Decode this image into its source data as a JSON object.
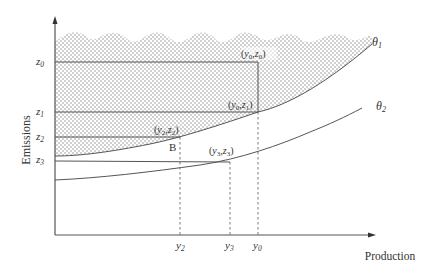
{
  "axes": {
    "y_label": "Emissions",
    "x_label": "Production"
  },
  "y_ticks": [
    {
      "id": "z0",
      "base": "z",
      "sub": "0"
    },
    {
      "id": "z1",
      "base": "z",
      "sub": "1"
    },
    {
      "id": "z2",
      "base": "z",
      "sub": "2"
    },
    {
      "id": "z3",
      "base": "z",
      "sub": "3"
    }
  ],
  "x_ticks": [
    {
      "id": "y2",
      "base": "y",
      "sub": "2"
    },
    {
      "id": "y3",
      "base": "y",
      "sub": "3"
    },
    {
      "id": "y0",
      "base": "y",
      "sub": "0"
    }
  ],
  "curves": [
    {
      "id": "theta1",
      "base": "θ",
      "sub": "1",
      "role": "upper frontier, shaded region above"
    },
    {
      "id": "theta2",
      "base": "θ",
      "sub": "2",
      "role": "lower frontier"
    }
  ],
  "points": [
    {
      "id": "y0z0",
      "label": "(y0,z0)",
      "x": "y0",
      "z": "z0"
    },
    {
      "id": "y0z1",
      "label": "(y0,z1)",
      "x": "y0",
      "z": "z1"
    },
    {
      "id": "y2z2",
      "label": "(y2,z2)",
      "x": "y2",
      "z": "z2"
    },
    {
      "id": "y3z3",
      "label": "(y3,z3)",
      "x": "y3",
      "z": "z3"
    }
  ],
  "marker": {
    "label": "B"
  },
  "colors": {
    "line": "#555555",
    "dots": "#777777",
    "text": "#333333"
  }
}
